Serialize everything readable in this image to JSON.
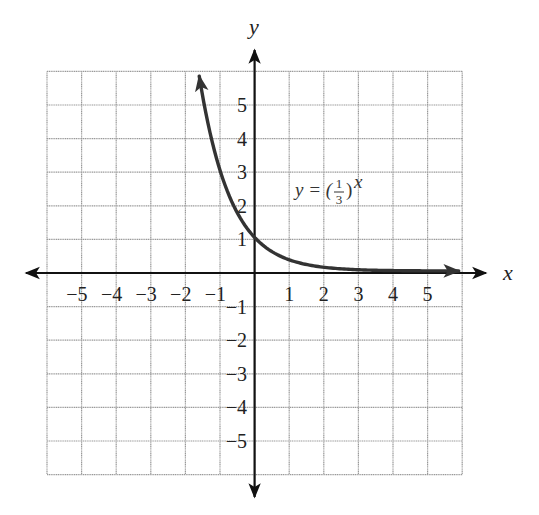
{
  "chart_data": {
    "type": "line",
    "title": "",
    "function": "y = (1/3)^x",
    "xlabel": "x",
    "ylabel": "y",
    "xlim": [
      -6,
      6
    ],
    "ylim": [
      -6,
      6
    ],
    "grid": true,
    "x_ticks": [
      -5,
      -4,
      -3,
      -2,
      -1,
      1,
      2,
      3,
      4,
      5
    ],
    "y_ticks": [
      5,
      4,
      3,
      2,
      1,
      -1,
      -2,
      -3,
      -4,
      -5
    ],
    "series": [
      {
        "name": "y = (1/3)^x",
        "x": [
          -1.6,
          -1.5,
          -1.0,
          -0.5,
          0,
          0.5,
          1,
          1.5,
          2,
          2.5,
          3,
          4,
          5,
          5.9
        ],
        "y": [
          5.8,
          5.2,
          3.0,
          1.73,
          1.0,
          0.58,
          0.33,
          0.19,
          0.11,
          0.06,
          0.04,
          0.01,
          0.004,
          0.0015
        ]
      }
    ],
    "annotations": [
      {
        "text": "y = (1/3)^x",
        "x": 1.2,
        "y": 2.3
      }
    ],
    "legend": null
  },
  "labels": {
    "x_axis": "x",
    "y_axis": "y",
    "x_ticks": [
      "−5",
      "−4",
      "−3",
      "−2",
      "−1",
      "1",
      "2",
      "3",
      "4",
      "5"
    ],
    "y_ticks_pos": [
      "5",
      "4",
      "3",
      "2",
      "1"
    ],
    "y_ticks_neg": [
      "−1",
      "−2",
      "−3",
      "−4",
      "−5"
    ],
    "equation": {
      "lhs": "y = (",
      "num": "1",
      "den": "3",
      "rparen": ")",
      "exp": "x"
    }
  },
  "colors": {
    "grid": "#9a9a9a",
    "axis": "#111111",
    "curve": "#333333",
    "background": "#ffffff"
  }
}
